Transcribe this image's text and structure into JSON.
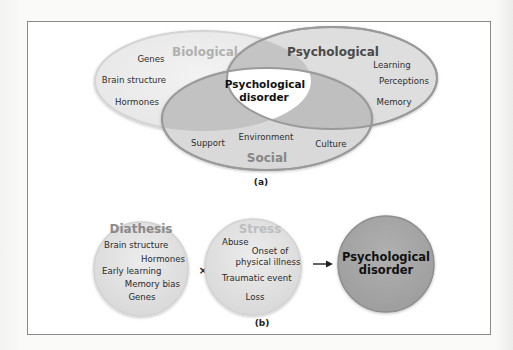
{
  "panel_a": {
    "label": "(a)",
    "circles": {
      "biological": {
        "title": "Biological",
        "items": [
          "Genes",
          "Brain structure",
          "Hormones"
        ],
        "fill": "#ededed",
        "stroke": "#d6d6d6",
        "title_color": "#aeaeae"
      },
      "psychological": {
        "title": "Psychological",
        "items": [
          "Learning",
          "Perceptions",
          "Memory"
        ],
        "fill": "#dedede",
        "stroke": "#9a9a9a",
        "title_color": "#4a4a4a"
      },
      "social": {
        "title": "Social",
        "items": [
          "Support",
          "Environment",
          "Culture"
        ],
        "fill": "#d8d8d8",
        "stroke": "#9a9a9a",
        "title_color": "#858585"
      }
    },
    "center": {
      "line1": "Psychological",
      "line2": "disorder",
      "fill": "#ffffff"
    },
    "overlap_color": "#bdbdbd"
  },
  "panel_b": {
    "label": "(b)",
    "diathesis": {
      "title": "Diathesis",
      "items": [
        "Brain structure",
        "Hormones",
        "Early learning",
        "Memory bias",
        "Genes"
      ],
      "fill": "#e6e6e6",
      "title_color": "#8a8a8a"
    },
    "operator": "×",
    "stress": {
      "title": "Stress",
      "items": [
        "Abuse",
        "Onset of",
        "physical illness",
        "Traumatic event",
        "Loss"
      ],
      "fill": "#dedede",
      "title_color": "#bdbdbd"
    },
    "arrow": "→",
    "outcome": {
      "line1": "Psychological",
      "line2": "disorder",
      "fill": "#a9a9a9"
    }
  }
}
